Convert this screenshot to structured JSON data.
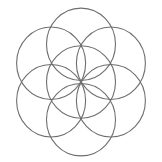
{
  "page": {
    "background_color": "#ffffff",
    "width": 162,
    "height": 162
  },
  "figure": {
    "name": "seed-of-life",
    "stroke_color": "#6e6e6e",
    "stroke_width": 1.1,
    "fill": "none",
    "center": {
      "x": 81,
      "y": 82
    },
    "radius": 34.5,
    "ring_spacing": 34.5,
    "vertical_scale": 1.05,
    "circle_count": 7,
    "circles": [
      {
        "id": "center",
        "label": "center-circle",
        "cx": 81,
        "cy": 82,
        "r": 34.5
      },
      {
        "id": "top",
        "label": "top-circle",
        "cx": 81,
        "cy": 46.1,
        "r": 34.5
      },
      {
        "id": "upper-right",
        "label": "upper-right-circle",
        "cx": 110.9,
        "cy": 64.1,
        "r": 34.5
      },
      {
        "id": "lower-right",
        "label": "lower-right-circle",
        "cx": 110.9,
        "cy": 99.9,
        "r": 34.5
      },
      {
        "id": "bottom",
        "label": "bottom-circle",
        "cx": 81,
        "cy": 117.9,
        "r": 34.5
      },
      {
        "id": "lower-left",
        "label": "lower-left-circle",
        "cx": 51.1,
        "cy": 99.9,
        "r": 34.5
      },
      {
        "id": "upper-left",
        "label": "upper-left-circle",
        "cx": 51.1,
        "cy": 64.1,
        "r": 34.5
      }
    ],
    "bounds": {
      "left": 14,
      "top": 12,
      "right": 148,
      "bottom": 152
    }
  }
}
